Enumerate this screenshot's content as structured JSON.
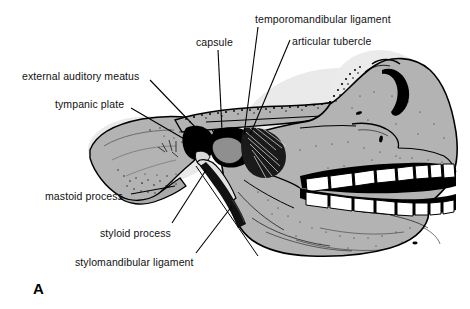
{
  "figure": {
    "panel_letter": "A",
    "background_color": "#ffffff",
    "bone_fill_color": "#b3b3b3",
    "outline_color": "#000000",
    "tooth_color": "#ffffff",
    "leader_line_color": "#000000",
    "text_color": "#111111"
  },
  "labels": [
    {
      "id": "capsule",
      "text": "capsule",
      "x": 196,
      "y": 36,
      "leader": {
        "x1": 218,
        "y1": 50,
        "x2": 222,
        "y2": 130
      }
    },
    {
      "id": "temporomandibular-ligament",
      "text": "temporomandibular ligament",
      "x": 255,
      "y": 13,
      "leader": {
        "x1": 258,
        "y1": 27,
        "x2": 244,
        "y2": 135
      }
    },
    {
      "id": "articular-tubercle",
      "text": "articular tubercle",
      "x": 292,
      "y": 35,
      "leader": {
        "x1": 290,
        "y1": 40,
        "x2": 250,
        "y2": 135
      }
    },
    {
      "id": "external-auditory-meatus",
      "text": "external auditory meatus",
      "x": 22,
      "y": 70,
      "leader": {
        "x1": 150,
        "y1": 80,
        "x2": 198,
        "y2": 130
      }
    },
    {
      "id": "tympanic-plate",
      "text": "tympanic plate",
      "x": 55,
      "y": 98,
      "leader": {
        "x1": 131,
        "y1": 108,
        "x2": 186,
        "y2": 140
      }
    },
    {
      "id": "mastoid-process",
      "text": "mastoid process",
      "x": 45,
      "y": 190,
      "leader": {
        "x1": 131,
        "y1": 194,
        "x2": 175,
        "y2": 186
      }
    },
    {
      "id": "styloid-process",
      "text": "styloid process",
      "x": 100,
      "y": 227,
      "leader": {
        "x1": 172,
        "y1": 223,
        "x2": 206,
        "y2": 170
      }
    },
    {
      "id": "stylomandibular-ligament",
      "text": "stylomandibular ligament",
      "x": 75,
      "y": 256,
      "leader": {
        "x1": 196,
        "y1": 253,
        "x2": 232,
        "y2": 206
      }
    }
  ]
}
